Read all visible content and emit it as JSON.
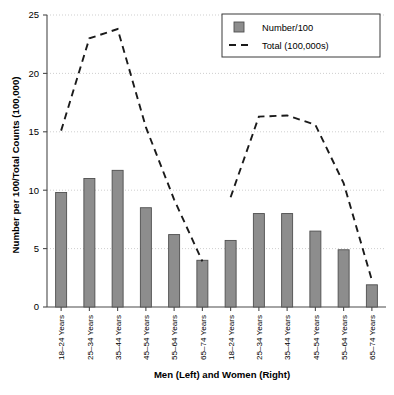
{
  "chart_data": {
    "type": "bar",
    "title": "",
    "xlabel": "Men (Left) and Women (Right)",
    "ylabel": "Number per 100/Total Counts (100,000)",
    "ylim": [
      0,
      25
    ],
    "yticks": [
      0,
      5,
      10,
      15,
      20,
      25
    ],
    "grid": true,
    "legend_position": "top-right",
    "categories": [
      "18–24 Years",
      "25–34 Years",
      "35–44 Years",
      "45–54 Years",
      "55–64 Years",
      "65–74 Years",
      "18–24 Years",
      "25–34 Years",
      "35–44 Years",
      "45–54 Years",
      "55–64 Years",
      "65–74 Years"
    ],
    "groups": [
      {
        "name": "Men (Left)",
        "categories": [
          "18–24 Years",
          "25–34 Years",
          "35–44 Years",
          "45–54 Years",
          "55–64 Years",
          "65–74 Years"
        ]
      },
      {
        "name": "Women (Right)",
        "categories": [
          "18–24 Years",
          "25–34 Years",
          "35–44 Years",
          "45–54 Years",
          "55–64 Years",
          "65–74 Years"
        ]
      }
    ],
    "series": [
      {
        "name": "Number/100",
        "type": "bar",
        "values": [
          9.8,
          11.0,
          11.7,
          8.5,
          6.2,
          4.0,
          5.7,
          8.0,
          8.0,
          6.5,
          4.9,
          1.9
        ]
      },
      {
        "name": "Total (100,000s)",
        "type": "line",
        "style": "dashed",
        "values": [
          15.1,
          23.0,
          23.8,
          15.4,
          9.2,
          3.9,
          9.4,
          16.3,
          16.4,
          15.6,
          10.6,
          2.3
        ]
      }
    ]
  },
  "legend": {
    "entries": [
      {
        "label": "Number/100",
        "marker": "bar-swatch",
        "color": "#8d8d8d"
      },
      {
        "label": "Total (100,000s)",
        "marker": "dashed-line",
        "color": "#1a1a1a"
      }
    ]
  },
  "axes": {
    "y_tick_labels": [
      "0",
      "5",
      "10",
      "15",
      "20",
      "25"
    ],
    "y_axis_title": "Number per 100/Total Counts (100,000)",
    "x_axis_title": "Men (Left) and Women (Right)"
  },
  "colors": {
    "bar_fill": "#8d8d8d",
    "bar_stroke": "#4f4f4f",
    "line": "#1a1a1a",
    "grid": "#c9c9c9",
    "axis": "#4a4a4a",
    "background": "#ffffff"
  }
}
